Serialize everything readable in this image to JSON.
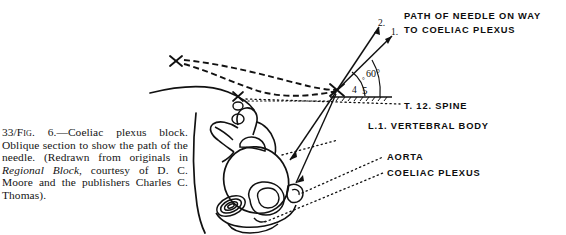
{
  "figure": {
    "caption_number": "33/",
    "caption_figlabel": "Fig. 6.",
    "caption_dash": "—",
    "caption_line_a": "Coeliac plexus block. Oblique section to show the path of the needle. (Redrawn from originals in ",
    "caption_italic_1": "Regional Block",
    "caption_line_b": ", courtesy of D. C. Moore and the publishers Charles C. Thomas).",
    "caption_full": "33/Fig. 6.—Coeliac plexus block. Oblique section to show the path of the needle. (Redrawn from originals in Regional Block, courtesy of D. C. Moore and the publishers Charles C. Thomas)."
  },
  "annotations": {
    "needle_path_line1": "PATH OF NEEDLE ON WAY",
    "needle_path_line2": "TO COELIAC PLEXUS",
    "t12_spine": "T. 12. SPINE",
    "l1_vertebral_body": "L.1. VERTEBRAL BODY",
    "aorta": "AORTA",
    "coeliac_plexus": "COELIAC PLEXUS"
  },
  "markers": {
    "needle_1": "1.",
    "needle_2": "2.",
    "angle_4": "4",
    "angle_5": "5",
    "degree_small": "°",
    "angle_60": "60°"
  },
  "colors": {
    "ink": "#0d0d0d",
    "background": "#ffffff",
    "caption_text": "#141414"
  }
}
